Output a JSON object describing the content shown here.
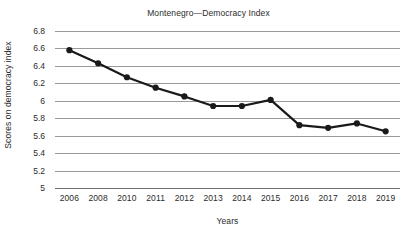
{
  "chart_data": {
    "type": "line",
    "title": "Montenegro—Democracy Index",
    "xlabel": "Years",
    "ylabel": "Scores on democracy index",
    "categories": [
      "2006",
      "2008",
      "2010",
      "2011",
      "2012",
      "2013",
      "2014",
      "2015",
      "2016",
      "2017",
      "2018",
      "2019"
    ],
    "values": [
      6.58,
      6.43,
      6.27,
      6.15,
      6.05,
      5.94,
      5.94,
      6.01,
      5.72,
      5.69,
      5.74,
      5.65
    ],
    "series": [
      {
        "name": "Democracy index score",
        "values": [
          6.58,
          6.43,
          6.27,
          6.15,
          6.05,
          5.94,
          5.94,
          6.01,
          5.72,
          5.69,
          5.74,
          5.65
        ]
      }
    ],
    "ylim": [
      5,
      6.8
    ],
    "ytick_labels": [
      "6.8",
      "6.6",
      "6.4",
      "6.2",
      "6",
      "5.8",
      "5.6",
      "5.4",
      "5.2",
      "5"
    ],
    "ytick_values": [
      6.8,
      6.6,
      6.4,
      6.2,
      6.0,
      5.8,
      5.6,
      5.4,
      5.2,
      5.0
    ],
    "ytick_step": 0.2,
    "grid": true,
    "legend": "none",
    "marker": "circle",
    "line_color": "#1a1a1a",
    "marker_color": "#1a1a1a",
    "grid_color": "#9a9a9a",
    "axis_color": "#6e6e6e",
    "text_color": "#2b2b2b",
    "background": "#ffffff"
  }
}
